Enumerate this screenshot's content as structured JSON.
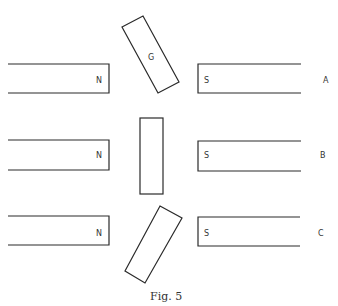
{
  "diagram": {
    "caption": "Fig. 5",
    "rows": [
      {
        "label": "A",
        "left_magnet_pole": "N",
        "right_magnet_pole": "S",
        "coil_label": "G",
        "coil_orientation": "tilted clockwise"
      },
      {
        "label": "B",
        "left_magnet_pole": "N",
        "right_magnet_pole": "S",
        "coil_label": "",
        "coil_orientation": "vertical"
      },
      {
        "label": "C",
        "left_magnet_pole": "N",
        "right_magnet_pole": "S",
        "coil_label": "",
        "coil_orientation": "tilted counter-clockwise"
      }
    ]
  }
}
